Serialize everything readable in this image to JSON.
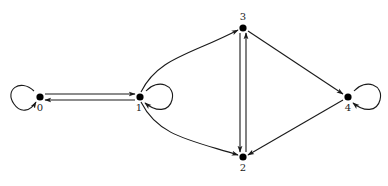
{
  "diagram": {
    "type": "directed-graph",
    "colors": {
      "stroke": "#1a1a1a",
      "node": "#000000",
      "label": "#222222",
      "background": "#ffffff"
    },
    "nodes": [
      {
        "id": "0",
        "label": "0",
        "x": 40,
        "y": 97,
        "label_x": 40,
        "label_y": 111
      },
      {
        "id": "1",
        "label": "1",
        "x": 140,
        "y": 97,
        "label_x": 139,
        "label_y": 111
      },
      {
        "id": "2",
        "label": "2",
        "x": 243,
        "y": 157,
        "label_x": 243,
        "label_y": 171
      },
      {
        "id": "3",
        "label": "3",
        "x": 243,
        "y": 28,
        "label_x": 243,
        "label_y": 20
      },
      {
        "id": "4",
        "label": "4",
        "x": 348,
        "y": 97,
        "label_x": 348,
        "label_y": 111
      }
    ],
    "edges": [
      {
        "from": "0",
        "to": "0",
        "kind": "self-loop",
        "side": "left"
      },
      {
        "from": "0",
        "to": "1",
        "kind": "straight"
      },
      {
        "from": "1",
        "to": "0",
        "kind": "straight"
      },
      {
        "from": "1",
        "to": "1",
        "kind": "self-loop",
        "side": "right"
      },
      {
        "from": "1",
        "to": "3",
        "kind": "curved"
      },
      {
        "from": "1",
        "to": "2",
        "kind": "curved"
      },
      {
        "from": "3",
        "to": "2",
        "kind": "straight"
      },
      {
        "from": "2",
        "to": "3",
        "kind": "straight"
      },
      {
        "from": "3",
        "to": "4",
        "kind": "straight"
      },
      {
        "from": "4",
        "to": "2",
        "kind": "straight"
      },
      {
        "from": "4",
        "to": "4",
        "kind": "self-loop",
        "side": "right"
      }
    ]
  }
}
